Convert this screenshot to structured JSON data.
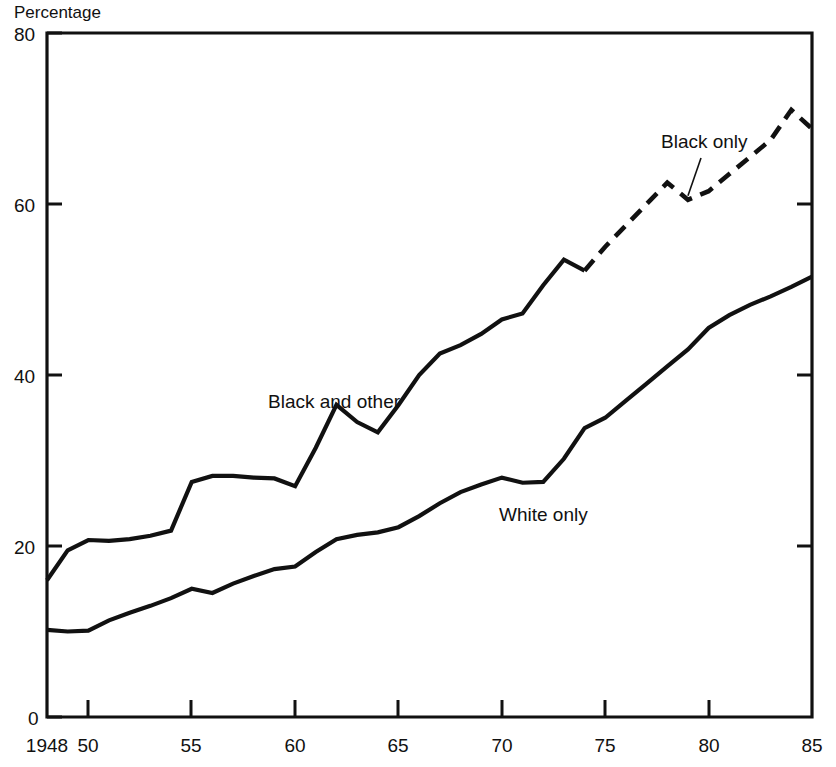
{
  "chart_data": {
    "type": "line",
    "title": "",
    "subtitle": "",
    "xlabel": "",
    "ylabel": "Percentage",
    "ylabel_position": "top-left",
    "xlim": [
      1948,
      1985
    ],
    "ylim": [
      0,
      80
    ],
    "grid": false,
    "legend": "inline-annotations",
    "x_tick_labels": [
      "1948",
      "50",
      "55",
      "60",
      "65",
      "70",
      "75",
      "80",
      "85"
    ],
    "x_tick_values": [
      1948,
      1950,
      1955,
      1960,
      1965,
      1970,
      1975,
      1980,
      1985
    ],
    "y_tick_labels": [
      "0",
      "20",
      "40",
      "60",
      "80"
    ],
    "y_tick_values": [
      0,
      20,
      40,
      60,
      80
    ],
    "series": [
      {
        "name": "Black and other",
        "style": "solid",
        "color": "#111111",
        "label": "Black and other",
        "x": [
          1948,
          1949,
          1950,
          1951,
          1952,
          1953,
          1954,
          1955,
          1956,
          1957,
          1958,
          1959,
          1960,
          1961,
          1962,
          1963,
          1964,
          1965,
          1966,
          1967,
          1968,
          1969,
          1970,
          1971,
          1972,
          1973,
          1974
        ],
        "values": [
          16.0,
          19.5,
          20.7,
          20.6,
          20.8,
          21.2,
          21.8,
          27.5,
          28.2,
          28.2,
          28.0,
          27.9,
          27.0,
          31.5,
          36.5,
          34.5,
          33.3,
          36.5,
          40.0,
          42.5,
          43.5,
          44.8,
          46.5,
          47.2,
          50.5,
          53.5,
          52.2
        ]
      },
      {
        "name": "Black only",
        "style": "dashed",
        "color": "#111111",
        "label": "Black only",
        "x": [
          1974,
          1975,
          1976,
          1977,
          1978,
          1979,
          1980,
          1981,
          1982,
          1983,
          1984,
          1985
        ],
        "values": [
          52.2,
          55.0,
          57.5,
          60.0,
          62.5,
          60.5,
          61.5,
          63.5,
          65.5,
          67.5,
          71.0,
          68.8
        ]
      },
      {
        "name": "White only",
        "style": "solid",
        "color": "#111111",
        "label": "White only",
        "x": [
          1948,
          1949,
          1950,
          1951,
          1952,
          1953,
          1954,
          1955,
          1956,
          1957,
          1958,
          1959,
          1960,
          1961,
          1962,
          1963,
          1964,
          1965,
          1966,
          1967,
          1968,
          1969,
          1970,
          1971,
          1972,
          1973,
          1974,
          1975,
          1976,
          1977,
          1978,
          1979,
          1980,
          1981,
          1982,
          1983,
          1984,
          1985
        ],
        "values": [
          10.2,
          10.0,
          10.1,
          11.3,
          12.2,
          13.0,
          13.9,
          15.0,
          14.5,
          15.6,
          16.5,
          17.3,
          17.6,
          19.3,
          20.8,
          21.3,
          21.6,
          22.2,
          23.5,
          25.0,
          26.3,
          27.2,
          28.0,
          27.4,
          27.5,
          30.2,
          33.8,
          35.0,
          37.0,
          39.0,
          41.0,
          43.0,
          45.5,
          47.0,
          48.2,
          49.2,
          50.3,
          51.5
        ]
      }
    ],
    "annotations": [
      {
        "text": "Black only",
        "series": "Black only",
        "leader_line": true,
        "points_to_x": 1979,
        "points_to_y": 60.5
      },
      {
        "text": "Black and other",
        "series": "Black and other",
        "leader_line": false
      },
      {
        "text": "White only",
        "series": "White only",
        "leader_line": false
      }
    ]
  },
  "axes": {
    "y_axis_title": "Percentage",
    "x_tick_labels": [
      "1948",
      "50",
      "55",
      "60",
      "65",
      "70",
      "75",
      "80",
      "85"
    ],
    "y_tick_labels": [
      "0",
      "20",
      "40",
      "60",
      "80"
    ]
  },
  "labels": {
    "black_only": "Black only",
    "black_and_other": "Black and other",
    "white_only": "White only"
  },
  "colors": {
    "line": "#111111",
    "axis": "#111111",
    "background": "#ffffff"
  }
}
